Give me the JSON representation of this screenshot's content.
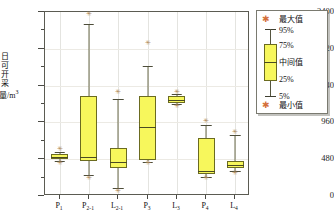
{
  "chart_data": {
    "type": "box",
    "title": "",
    "xlabel": "",
    "ylabel": "日可开采量/m³",
    "ylabel_text": "日可开采量/m",
    "ylabel_sup": "3",
    "ylim": [
      0,
      2400
    ],
    "yticks": [
      0,
      480,
      960,
      1440,
      1920,
      2400
    ],
    "ytick_labels": [
      "0",
      "480",
      "960",
      "1440",
      "1920",
      "2400"
    ],
    "minor_ticks": true,
    "grid": true,
    "categories": [
      "P₁",
      "P₂₋₁",
      "L₂₋₁",
      "P₃",
      "L₃",
      "P₄",
      "L₄"
    ],
    "category_labels": [
      {
        "base": "P",
        "sub": "1"
      },
      {
        "base": "P",
        "sub": "2-1"
      },
      {
        "base": "L",
        "sub": "2-1"
      },
      {
        "base": "P",
        "sub": "3"
      },
      {
        "base": "L",
        "sub": "3"
      },
      {
        "base": "P",
        "sub": "4"
      },
      {
        "base": "L",
        "sub": "4"
      }
    ],
    "boxes": [
      {
        "name": "P1",
        "min": 430,
        "p5": 455,
        "q1": 480,
        "median": 505,
        "q3": 545,
        "p95": 580,
        "max": 610
      },
      {
        "name": "P2-1",
        "min": 240,
        "p5": 275,
        "q1": 460,
        "median": 510,
        "q3": 1300,
        "p95": 2250,
        "max": 2370
      },
      {
        "name": "L2-1",
        "min": 60,
        "p5": 110,
        "q1": 360,
        "median": 450,
        "q3": 620,
        "p95": 1270,
        "max": 1360
      },
      {
        "name": "P3",
        "min": 425,
        "p5": 450,
        "q1": 470,
        "median": 900,
        "q3": 1310,
        "p95": 1700,
        "max": 1990
      },
      {
        "name": "L3",
        "min": 1175,
        "p5": 1195,
        "q1": 1215,
        "median": 1255,
        "q3": 1305,
        "p95": 1330,
        "max": 1355
      },
      {
        "name": "P4",
        "min": 230,
        "p5": 250,
        "q1": 290,
        "median": 330,
        "q3": 760,
        "p95": 930,
        "max": 980
      },
      {
        "name": "L4",
        "min": 300,
        "p5": 330,
        "q1": 365,
        "median": 400,
        "q3": 455,
        "p95": 790,
        "max": 840
      }
    ],
    "legend": {
      "position": "right",
      "entries": [
        {
          "marker": "star",
          "label": "最大值"
        },
        {
          "marker": "whisker-cap",
          "label": "95%"
        },
        {
          "marker": "box-top",
          "label": "75%"
        },
        {
          "marker": "median-line",
          "label": "中间值"
        },
        {
          "marker": "box-bottom",
          "label": "25%"
        },
        {
          "marker": "whisker-cap",
          "label": "5%"
        },
        {
          "marker": "star",
          "label": "最小值"
        }
      ]
    },
    "colors": {
      "box_fill": "#f7f75c",
      "box_edge": "#6b6b20",
      "whisker": "#6b6b4a",
      "median": "#4a4a22",
      "star": "#b08a5a",
      "legend_star": "#d4703a",
      "grid": "#e4e4e0",
      "frame": "#5b5b52",
      "background": "#ffffff"
    }
  }
}
